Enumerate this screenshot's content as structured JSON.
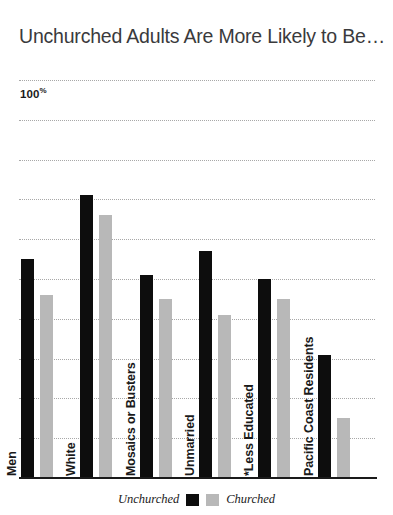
{
  "chart_data": {
    "type": "bar",
    "title": "Unchurched Adults Are More Likely to Be…",
    "xlabel": "",
    "ylabel": "",
    "ylim": [
      0,
      100
    ],
    "grid": true,
    "gridline_count": 11,
    "legend_position": "bottom-center",
    "axis_top_label": "100",
    "axis_top_suffix": "%",
    "categories": [
      "Men",
      "White",
      "Mosaics or Busters",
      "Unmarried",
      "*Less Educated",
      "Pacific Coast Residents"
    ],
    "series": [
      {
        "name": "Unchurched",
        "color": "#0d0d0d",
        "values": [
          55,
          71,
          51,
          57,
          50,
          31
        ]
      },
      {
        "name": "Churched",
        "color": "#b8b8b8",
        "values": [
          46,
          66,
          45,
          41,
          45,
          15
        ]
      }
    ]
  },
  "legend": {
    "unchurched_label": "Unchurched",
    "churched_label": "Churched"
  }
}
